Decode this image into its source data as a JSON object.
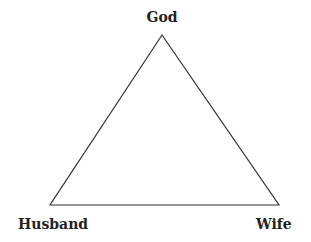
{
  "diagram": {
    "type": "triangle",
    "nodes": [
      {
        "id": "top",
        "label": "God"
      },
      {
        "id": "left",
        "label": "Husband"
      },
      {
        "id": "right",
        "label": "Wife"
      }
    ],
    "edges": [
      {
        "from": "top",
        "to": "left"
      },
      {
        "from": "left",
        "to": "right"
      },
      {
        "from": "right",
        "to": "top"
      }
    ],
    "colors": {
      "line": "#333333",
      "text": "#222222",
      "background": "#ffffff"
    }
  }
}
